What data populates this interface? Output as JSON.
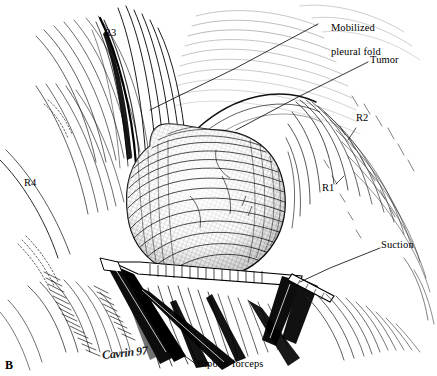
{
  "figure": {
    "panel_label": "B",
    "signature": "Cavrin 97",
    "medium": "pen-and-ink surgical illustration",
    "colors": {
      "ink": "#000000",
      "background": "#ffffff",
      "midtone": "#4a4a4a"
    }
  },
  "labels": {
    "r3": "R3",
    "r4": "R4",
    "r2": "R2",
    "r1": "R1",
    "mobilized_pleural_fold_line1": "Mobilized",
    "mobilized_pleural_fold_line2": "pleural fold",
    "tumor": "Tumor",
    "suction": "Suction",
    "bipolar_forceps": "Bipolar forceps"
  }
}
